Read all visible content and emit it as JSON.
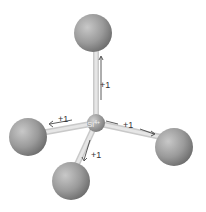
{
  "diagram": {
    "center_atom": {
      "label": "Si",
      "charge": "4+"
    },
    "bonds": [
      {
        "id": "top",
        "label": "+1"
      },
      {
        "id": "left",
        "label": "+1"
      },
      {
        "id": "right",
        "label": "+1"
      },
      {
        "id": "front",
        "label": "+1"
      }
    ],
    "colors": {
      "atom": "#9a9a9a",
      "bond": "#d8d8d8",
      "text": "#333333"
    }
  }
}
